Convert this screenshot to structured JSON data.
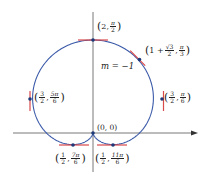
{
  "diagram": {
    "type": "polar-curve",
    "curve": "cardioid r = 1 + sin θ",
    "colors": {
      "curve": "#3b5aa8",
      "tangent": "#d8494a",
      "axis": "#555555",
      "point": "#1e3a78"
    },
    "slope_label": "m = −1",
    "origin_label": "(0, 0)",
    "points": [
      {
        "id": "top",
        "r": "2",
        "theta_num": "π",
        "theta_den": "2"
      },
      {
        "id": "upper-right",
        "r_prefix": "1 +",
        "r_num": "√3",
        "r_den": "2",
        "theta_num": "π",
        "theta_den": "3"
      },
      {
        "id": "right",
        "r_num": "3",
        "r_den": "2",
        "theta_num": "π",
        "theta_den": "6"
      },
      {
        "id": "left",
        "r_num": "3",
        "r_den": "2",
        "theta_num": "5π",
        "theta_den": "6"
      },
      {
        "id": "bottom-left",
        "r_num": "1",
        "r_den": "2",
        "theta_num": "7π",
        "theta_den": "6"
      },
      {
        "id": "bottom-right",
        "r_num": "1",
        "r_den": "2",
        "theta_num": "11π",
        "theta_den": "6"
      }
    ]
  }
}
